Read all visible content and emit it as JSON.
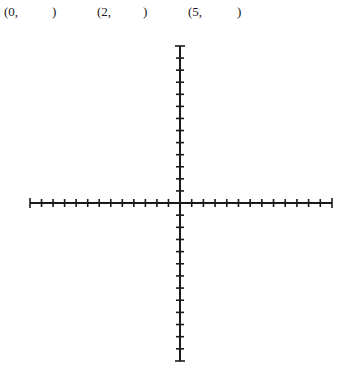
{
  "worksheet": {
    "coordinate_prompts": [
      {
        "open": "(0,",
        "close": ")",
        "x_open": 4,
        "x_close": 52
      },
      {
        "open": "(2,",
        "close": ")",
        "x_open": 97,
        "x_close": 143
      },
      {
        "open": "(5,",
        "close": ")",
        "x_open": 188,
        "x_close": 237
      }
    ],
    "coordinate_plane": {
      "type": "blank cartesian axes",
      "origin_px": {
        "x": 180,
        "y": 203
      },
      "x_axis": {
        "left_end_px": 30,
        "right_end_px": 332,
        "ticks_left": 13,
        "ticks_right": 13
      },
      "y_axis": {
        "top_end_px": 46,
        "bottom_end_px": 361,
        "ticks_up": 13,
        "ticks_down": 13
      },
      "tick_half_length_px": 4,
      "line_color": "#1a1a1a",
      "line_width_px": 2
    }
  }
}
